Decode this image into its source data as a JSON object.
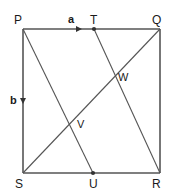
{
  "figure": {
    "type": "geometry-diagram",
    "shape": "square",
    "canvas": {
      "width": 174,
      "height": 192
    },
    "stroke_color": "#555555",
    "label_color": "#1a1a1a",
    "background_color": "#ffffff"
  },
  "vertices": [
    {
      "id": "P",
      "label": "P",
      "x": 23,
      "y": 29,
      "label_x": 14,
      "label_y": 14,
      "name": "vertex-p"
    },
    {
      "id": "Q",
      "label": "Q",
      "x": 160,
      "y": 29,
      "label_x": 152,
      "label_y": 14,
      "name": "vertex-q"
    },
    {
      "id": "R",
      "label": "R",
      "x": 160,
      "y": 173,
      "label_x": 152,
      "label_y": 178,
      "name": "vertex-r"
    },
    {
      "id": "S",
      "label": "S",
      "x": 23,
      "y": 173,
      "label_x": 15,
      "label_y": 178,
      "name": "vertex-s"
    }
  ],
  "points": [
    {
      "id": "T",
      "label": "T",
      "x": 94,
      "y": 29,
      "label_x": 90,
      "label_y": 14,
      "dot": true,
      "name": "point-t"
    },
    {
      "id": "U",
      "label": "U",
      "x": 93,
      "y": 173,
      "label_x": 89,
      "label_y": 178,
      "dot": true,
      "name": "point-u"
    }
  ],
  "intersections": [
    {
      "id": "V",
      "label": "V",
      "x": 73,
      "y": 122,
      "label_x": 77,
      "label_y": 119,
      "name": "intersection-v"
    },
    {
      "id": "W",
      "label": "W",
      "x": 113,
      "y": 76,
      "label_x": 118,
      "label_y": 72,
      "name": "intersection-w"
    }
  ],
  "vectors": [
    {
      "id": "a",
      "label": "a",
      "edge": "top",
      "arrow_x": 80,
      "arrow_y": 29,
      "direction": "right",
      "label_x": 68,
      "label_y": 14,
      "name": "vector-a"
    },
    {
      "id": "b",
      "label": "b",
      "edge": "left",
      "arrow_x": 23,
      "arrow_y": 101,
      "direction": "down",
      "label_x": 10,
      "label_y": 95,
      "name": "vector-b"
    }
  ],
  "edges": [
    {
      "id": "PQ",
      "from": "P",
      "to": "Q",
      "name": "edge-pq"
    },
    {
      "id": "QR",
      "from": "Q",
      "to": "R",
      "name": "edge-qr"
    },
    {
      "id": "RS",
      "from": "R",
      "to": "S",
      "name": "edge-rs"
    },
    {
      "id": "SP",
      "from": "S",
      "to": "P",
      "name": "edge-sp"
    }
  ],
  "segments": [
    {
      "id": "PU",
      "from": "P",
      "to": "U",
      "x1": 23,
      "y1": 29,
      "x2": 93,
      "y2": 173,
      "name": "segment-pu"
    },
    {
      "id": "TR",
      "from": "T",
      "to": "R",
      "x1": 94,
      "y1": 29,
      "x2": 160,
      "y2": 173,
      "name": "segment-tr"
    },
    {
      "id": "SQ",
      "from": "S",
      "to": "Q",
      "x1": 23,
      "y1": 173,
      "x2": 160,
      "y2": 29,
      "name": "segment-sq"
    }
  ]
}
